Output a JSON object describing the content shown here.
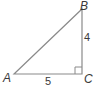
{
  "diagram": {
    "type": "right-triangle",
    "vertices": {
      "A": {
        "label": "A"
      },
      "B": {
        "label": "B"
      },
      "C": {
        "label": "C"
      }
    },
    "sides": {
      "BC": {
        "label": "4"
      },
      "AC": {
        "label": "5"
      }
    },
    "right_angle_at": "C",
    "stroke_color": "#8a8a8a",
    "label_color": "#3a3a3a"
  }
}
